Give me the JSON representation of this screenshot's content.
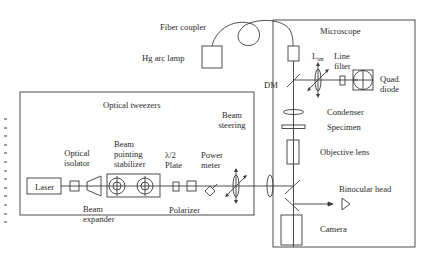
{
  "diagram": {
    "external": {
      "fiber_coupler": "Fiber coupler",
      "hg_arc_lamp": "Hg arc lamp"
    },
    "optical_tweezers": {
      "title": "Optical tweezers",
      "components": {
        "laser": "Laser",
        "optical_isolator_1": "Optical",
        "optical_isolator_2": "isolator",
        "beam_expander_1": "Beam",
        "beam_expander_2": "expander",
        "beam_pointing_1": "Beam",
        "beam_pointing_2": "pointing",
        "beam_pointing_3": "stabilizer",
        "half_wave_1": "λ/2",
        "half_wave_2": "Plate",
        "polarizer": "Polarizer",
        "power_meter_1": "Power",
        "power_meter_2": "meter",
        "beam_steering_1": "Beam",
        "beam_steering_2": "steering"
      }
    },
    "microscope": {
      "title": "Microscope",
      "components": {
        "lim_main": "L",
        "lim_sub": "im",
        "line_filter_1": "Line",
        "line_filter_2": "filter",
        "quad_diode_1": "Quad.",
        "quad_diode_2": "diode",
        "dm": "DM",
        "condenser": "Condenser",
        "specimen": "Specimen",
        "objective_lens": "Objective lens",
        "binocular_head": "Binocular head",
        "camera": "Camera"
      }
    },
    "colors": {
      "line": "#3a3a3a",
      "text": "#2a2a2a",
      "background": "#ffffff"
    }
  }
}
